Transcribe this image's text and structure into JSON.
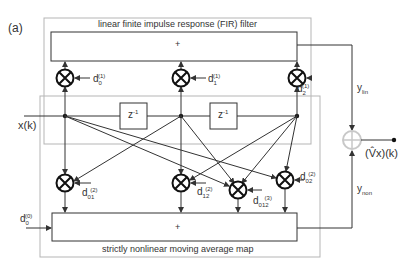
{
  "panel_label": "(a)",
  "fir_block": {
    "title": "linear finite impulse response (FIR) filter",
    "sum_symbol": "+"
  },
  "nonlinear_block": {
    "title": "strictly nonlinear moving average map",
    "sum_symbol": "+"
  },
  "input_label": "x(k)",
  "delay_label": "z",
  "delay_exp": "-1",
  "output_label": "(V̂x)(k)",
  "signals": {
    "linear": {
      "base": "y",
      "sub": "lin"
    },
    "nonlinear": {
      "base": "y",
      "sub": "non"
    }
  },
  "coefficients": {
    "d0_1": {
      "base": "d",
      "sub": "0",
      "sup": "(1)"
    },
    "d1_1": {
      "base": "d",
      "sub": "1",
      "sup": "(1)"
    },
    "d2_1": {
      "base": "d",
      "sub": "2",
      "sup": "(1)"
    },
    "d01_2": {
      "base": "d",
      "sub": "01",
      "sup": "(2)"
    },
    "d12_2": {
      "base": "d",
      "sub": "12",
      "sup": "(2)"
    },
    "d012_3": {
      "base": "d",
      "sub": "012",
      "sup": "(3)"
    },
    "d02_2": {
      "base": "d",
      "sub": "02",
      "sup": "(2)"
    },
    "d0_0": {
      "base": "d",
      "sub": "0",
      "sup": "(0)"
    }
  },
  "colors": {
    "line": "#333333",
    "frame": "#b5b5b5",
    "adder": "#c8c8c8"
  }
}
